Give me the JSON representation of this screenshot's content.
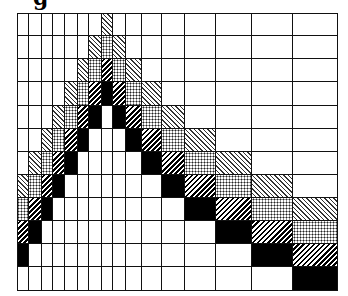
{
  "caption": "g",
  "legend_types": {
    "0": "white",
    "1": "light-diagonal-hatch",
    "2": "dotted",
    "3": "dense-diagonal-hatch",
    "4": "black"
  },
  "colors": {
    "line": "#111111",
    "fill_black": "#000000",
    "background": "#ffffff"
  },
  "grid": {
    "col_widths": [
      12,
      13,
      11,
      12,
      13,
      11,
      13,
      11,
      13,
      16,
      20,
      23,
      31,
      36,
      41,
      45
    ],
    "row_heights": [
      23,
      23,
      23,
      24,
      23,
      23,
      23,
      23,
      23,
      23,
      23,
      24
    ],
    "cells": [
      [
        0,
        0,
        0,
        0,
        0,
        0,
        0,
        1,
        0,
        0,
        0,
        0,
        0,
        0,
        0,
        0
      ],
      [
        0,
        0,
        0,
        0,
        0,
        0,
        1,
        2,
        1,
        0,
        0,
        0,
        0,
        0,
        0,
        0
      ],
      [
        0,
        0,
        0,
        0,
        0,
        1,
        2,
        3,
        2,
        1,
        0,
        0,
        0,
        0,
        0,
        0
      ],
      [
        0,
        0,
        0,
        0,
        1,
        2,
        3,
        4,
        3,
        2,
        1,
        0,
        0,
        0,
        0,
        0
      ],
      [
        0,
        0,
        0,
        1,
        2,
        3,
        4,
        0,
        4,
        3,
        2,
        1,
        0,
        0,
        0,
        0
      ],
      [
        0,
        0,
        1,
        2,
        3,
        4,
        0,
        0,
        0,
        4,
        3,
        2,
        1,
        0,
        0,
        0
      ],
      [
        0,
        1,
        2,
        3,
        4,
        0,
        0,
        0,
        0,
        0,
        4,
        3,
        2,
        1,
        0,
        0
      ],
      [
        1,
        2,
        3,
        4,
        0,
        0,
        0,
        0,
        0,
        0,
        0,
        4,
        3,
        2,
        1,
        0
      ],
      [
        2,
        3,
        4,
        0,
        0,
        0,
        0,
        0,
        0,
        0,
        0,
        0,
        4,
        3,
        2,
        1
      ],
      [
        3,
        4,
        0,
        0,
        0,
        0,
        0,
        0,
        0,
        0,
        0,
        0,
        0,
        4,
        3,
        2
      ],
      [
        4,
        0,
        0,
        0,
        0,
        0,
        0,
        0,
        0,
        0,
        0,
        0,
        0,
        0,
        4,
        3
      ],
      [
        0,
        0,
        0,
        0,
        0,
        0,
        0,
        0,
        0,
        0,
        0,
        0,
        0,
        0,
        0,
        4
      ]
    ]
  }
}
